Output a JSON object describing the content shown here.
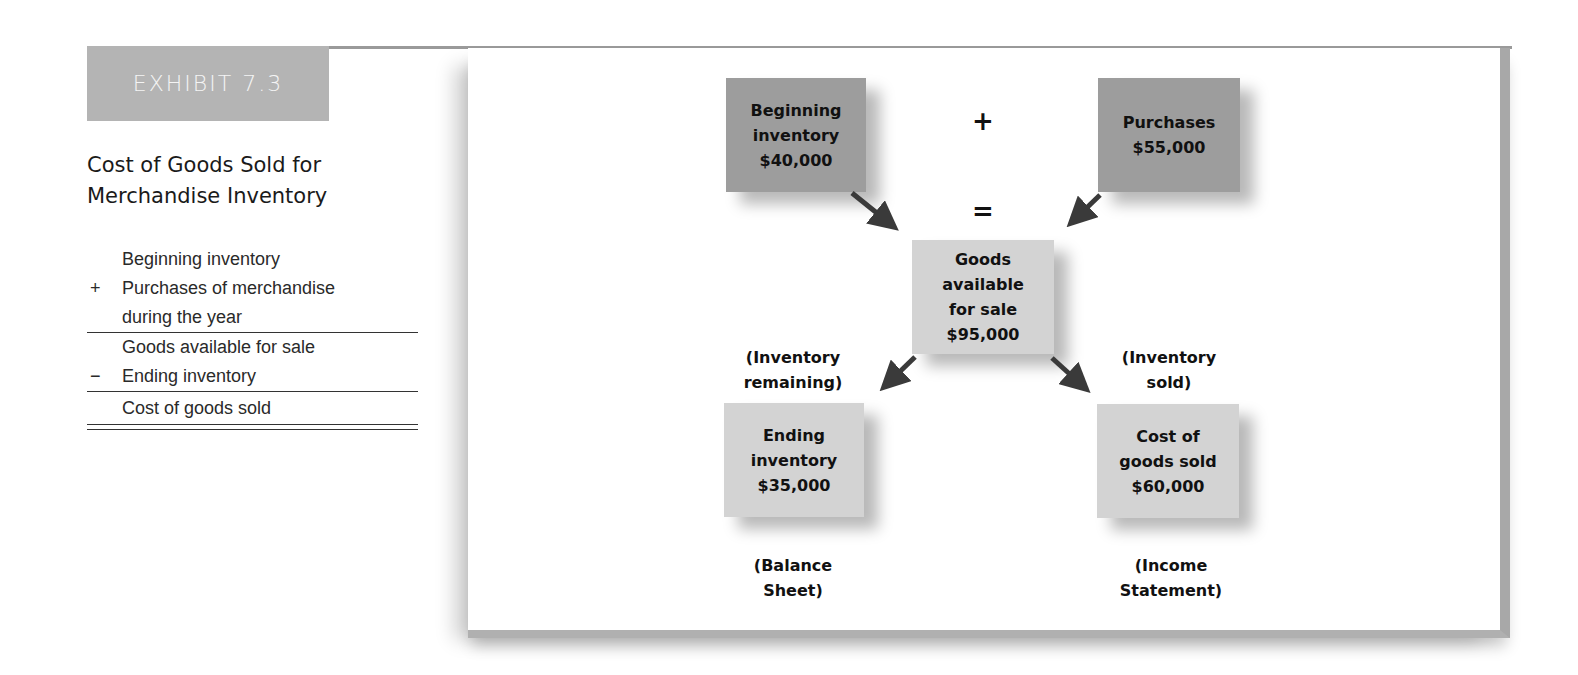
{
  "exhibit": {
    "tab_label": "EXHIBIT 7.3",
    "title_line1": "Cost of Goods Sold for",
    "title_line2": "Merchandise Inventory"
  },
  "formula": {
    "rows": [
      {
        "op": "",
        "text": "Beginning inventory"
      },
      {
        "op": "+",
        "text": "Purchases of merchandise"
      },
      {
        "op": "",
        "text": "during the year"
      },
      {
        "op": "",
        "text": "Goods available for sale"
      },
      {
        "op": "−",
        "text": "Ending inventory"
      },
      {
        "op": "",
        "text": "Cost of goods sold"
      }
    ]
  },
  "diagram": {
    "plus_symbol": "+",
    "equals_symbol": "=",
    "beginning": {
      "line1": "Beginning",
      "line2": "inventory",
      "amount": "$40,000"
    },
    "purchases": {
      "line1": "Purchases",
      "amount": "$55,000"
    },
    "available": {
      "line1": "Goods",
      "line2": "available",
      "line3": "for sale",
      "amount": "$95,000"
    },
    "ending": {
      "line1": "Ending",
      "line2": "inventory",
      "amount": "$35,000"
    },
    "cogs": {
      "line1": "Cost of",
      "line2": "goods sold",
      "amount": "$60,000"
    },
    "label_remaining": {
      "line1": "(Inventory",
      "line2": "remaining)"
    },
    "label_sold": {
      "line1": "(Inventory",
      "line2": "sold)"
    },
    "label_balance": {
      "line1": "(Balance",
      "line2": "Sheet)"
    },
    "label_income": {
      "line1": "(Income",
      "line2": "Statement)"
    },
    "colors": {
      "dark_box": "#9d9d9d",
      "light_box": "#d3d3d3",
      "arrow": "#3a3a3a",
      "exhibit_tab": "#b4b4b4"
    }
  }
}
